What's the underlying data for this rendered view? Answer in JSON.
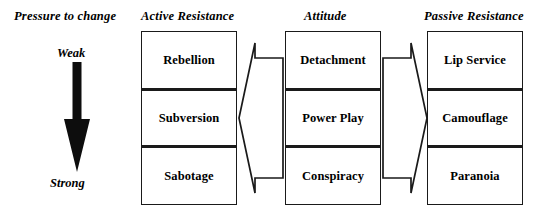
{
  "diagram": {
    "title_row": {
      "pressure_header": "Pressure to change",
      "active_header": "Active Resistance",
      "attitude_header": "Attitude",
      "passive_header": "Passive Resistance"
    },
    "pressure_gauge": {
      "top_label": "Weak",
      "bottom_label": "Strong",
      "arrow_direction": "down",
      "arrow_icon": "down-arrow-icon",
      "color": "#000000"
    },
    "columns": [
      {
        "id": "active-resistance",
        "header": "Active Resistance",
        "cells": [
          {
            "label": "Rebellion",
            "row": 0,
            "emphasis": false
          },
          {
            "label": "Subversion",
            "row": 1,
            "emphasis": true
          },
          {
            "label": "Sabotage",
            "row": 2,
            "emphasis": false
          }
        ]
      },
      {
        "id": "attitude",
        "header": "Attitude",
        "cells": [
          {
            "label": "Detachment",
            "row": 0,
            "emphasis": false
          },
          {
            "label": "Power Play",
            "row": 1,
            "emphasis": true
          },
          {
            "label": "Conspiracy",
            "row": 2,
            "emphasis": false
          }
        ]
      },
      {
        "id": "passive-resistance",
        "header": "Passive Resistance",
        "cells": [
          {
            "label": "Lip Service",
            "row": 0,
            "emphasis": false
          },
          {
            "label": "Camouflage",
            "row": 1,
            "emphasis": true
          },
          {
            "label": "Paranoia",
            "row": 2,
            "emphasis": false
          }
        ]
      }
    ],
    "connectors": [
      {
        "id": "attitude-to-active",
        "icon": "left-arrow-icon",
        "direction": "left",
        "from": "attitude",
        "to": "active-resistance"
      },
      {
        "id": "attitude-to-passive",
        "icon": "right-arrow-icon",
        "direction": "right",
        "from": "attitude",
        "to": "passive-resistance"
      }
    ],
    "style": {
      "background": "#ffffff",
      "line_color": "#1a1a1a",
      "text_color": "#000000"
    }
  }
}
